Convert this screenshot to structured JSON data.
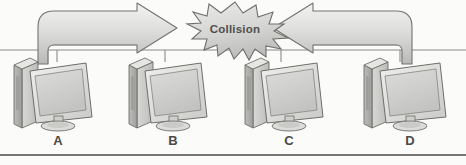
{
  "diagram": {
    "background_color": "#fbfbfa",
    "ink_color": "#6e6e6c",
    "fill_light": "#e4e4e2",
    "fill_mid": "#cfcfcd",
    "fill_dark": "#a9a9a7",
    "bottom_rule_color": "#4a4a48",
    "backbone": {
      "name": "shared-bus-cable",
      "y": 50,
      "x_start": 0,
      "x_end": 466
    },
    "collision": {
      "label": "Collision",
      "shape": "starburst",
      "center_x": 235,
      "center_y": 30
    },
    "arrows": [
      {
        "name": "frame-from-a",
        "direction": "right",
        "origin_node": "A",
        "label": ""
      },
      {
        "name": "frame-from-d",
        "direction": "left",
        "origin_node": "D",
        "label": ""
      }
    ],
    "nodes": [
      {
        "label": "A",
        "x": 50,
        "y": 133,
        "icon": "desktop-computer-icon"
      },
      {
        "label": "B",
        "x": 165,
        "y": 133,
        "icon": "desktop-computer-icon"
      },
      {
        "label": "C",
        "x": 280,
        "y": 133,
        "icon": "desktop-computer-icon"
      },
      {
        "label": "D",
        "x": 396,
        "y": 133,
        "icon": "desktop-computer-icon"
      }
    ]
  }
}
